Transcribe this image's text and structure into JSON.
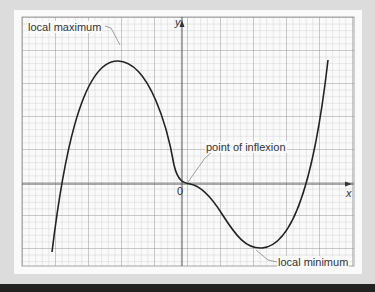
{
  "diagram": {
    "type": "cubic-like curve on grid",
    "labels": {
      "local_max": "local maximum",
      "local_min": "local minimum",
      "inflexion": "point of inflexion",
      "origin": "0",
      "x_axis": "x",
      "y_axis": "y"
    },
    "colors": {
      "grid_minor": "#b8b8b8",
      "grid_major": "#8a8a8a",
      "curve": "#222222",
      "leader": "#888888",
      "background": "#dcdcdc",
      "panel": "#fafafa"
    }
  }
}
